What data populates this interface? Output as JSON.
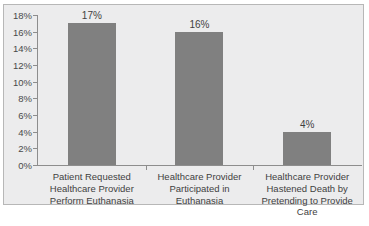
{
  "chart_data": {
    "type": "bar",
    "title": "",
    "subtitle": "",
    "xlabel": "",
    "ylabel": "",
    "categories": [
      "Patient Requested Healthcare Provider Perform Euthanasia",
      "Healthcare Provider Participated in Euthanasia",
      "Healthcare Provider Hastened Death by Pretending to Provide Care"
    ],
    "category_lines": [
      [
        "Patient Requested",
        "Healthcare Provider",
        "Perform Euthanasia"
      ],
      [
        "Healthcare Provider",
        "Participated in Euthanasia"
      ],
      [
        "Healthcare Provider",
        "Hastened Death by",
        "Pretending to Provide",
        "Care"
      ]
    ],
    "values": [
      17,
      16,
      4
    ],
    "data_labels": [
      "17%",
      "16%",
      "4%"
    ],
    "ylim": [
      0,
      18
    ],
    "ytick_values": [
      18,
      16,
      14,
      12,
      10,
      8,
      6,
      4,
      2,
      0
    ],
    "ytick_labels": [
      "18%",
      "16%",
      "14%",
      "12%",
      "10%",
      "8%",
      "6%",
      "4%",
      "2%",
      "0%"
    ],
    "grid": false,
    "legend": false,
    "legend_position": "none",
    "series": [
      {
        "name": "",
        "values": [
          17,
          16,
          4
        ]
      }
    ],
    "colors": {
      "bar": "#808080",
      "plot_background": "#ececed",
      "frame_border": "#b7b7b7",
      "axis_line": "#8d8d8d",
      "text": "#3f3f3f"
    }
  }
}
